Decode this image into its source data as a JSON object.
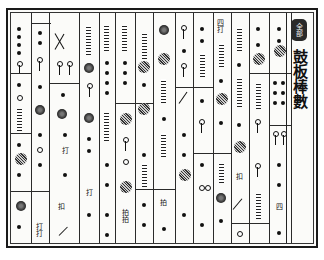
{
  "document": {
    "title": "鼓板棒數",
    "badge": "全部",
    "annotations": {
      "top_label": "四打",
      "strike_a": "打",
      "strike_b": "打打",
      "mark_a": "扣",
      "mark_b": "拍",
      "mark_c": "打",
      "mark_d": "四",
      "mark_e": "拍拍",
      "mark_f": "扣"
    },
    "notation": {
      "columns": 16,
      "symbols": [
        "filled-dot",
        "open-ring",
        "large-halftone-circle",
        "stick-stroke",
        "diagonal-stroke",
        "tremolo-hatch"
      ]
    }
  }
}
